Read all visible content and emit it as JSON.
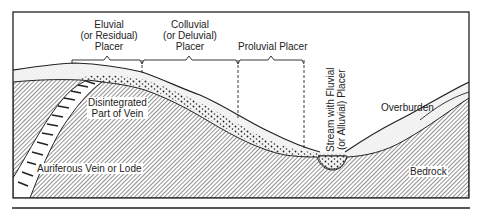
{
  "diagram": {
    "type": "geologic cross-section",
    "brackets": [
      {
        "id": "eluvial",
        "label": "Eluvial\n(or Residual)\nPlacer",
        "lines": [
          "Eluvial",
          "(or Residual)",
          "Placer"
        ]
      },
      {
        "id": "colluvial",
        "label": "Colluvial\n(or Deluvial)\nPlacer",
        "lines": [
          "Colluvial",
          "(or Deluvial)",
          "Placer"
        ]
      },
      {
        "id": "proluvial",
        "label": "Proluvial Placer",
        "lines": [
          "Proluvial Placer"
        ]
      }
    ],
    "labels": {
      "disintegrated": [
        "Disintegrated",
        "Part of Vein"
      ],
      "vein": "Auriferous Vein or Lode",
      "stream": [
        "Stream with Fluvial",
        "(or Alluvial) Placer"
      ],
      "overburden": "Overburden",
      "bedrock": "Bedrock"
    },
    "colors": {
      "line": "#222222",
      "background": "#ffffff",
      "hatch": "#555555"
    }
  }
}
